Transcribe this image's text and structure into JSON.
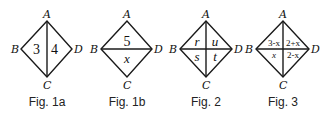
{
  "figures": [
    {
      "id": "fig1a",
      "caption": "Fig. 1a",
      "vertices": {
        "A": "A",
        "B": "B",
        "C": "C",
        "D": "D"
      },
      "divider": "vertical",
      "regions": {
        "left": "3",
        "right": "4"
      }
    },
    {
      "id": "fig1b",
      "caption": "Fig. 1b",
      "vertices": {
        "A": "A",
        "B": "B",
        "C": "C",
        "D": "D"
      },
      "divider": "horizontal",
      "regions": {
        "top": "5",
        "bottom": "x"
      }
    },
    {
      "id": "fig2",
      "caption": "Fig. 2",
      "vertices": {
        "A": "A",
        "B": "B",
        "C": "C",
        "D": "D"
      },
      "divider": "both",
      "regions": {
        "top_left": "r",
        "top_right": "u",
        "bottom_left": "s",
        "bottom_right": "t"
      }
    },
    {
      "id": "fig3",
      "caption": "Fig. 3",
      "vertices": {
        "A": "A",
        "B": "B",
        "C": "C",
        "D": "D"
      },
      "divider": "both",
      "regions": {
        "top_left": "3-x",
        "top_right": "2+x",
        "bottom_left": "x",
        "bottom_right": "2-x"
      }
    }
  ]
}
